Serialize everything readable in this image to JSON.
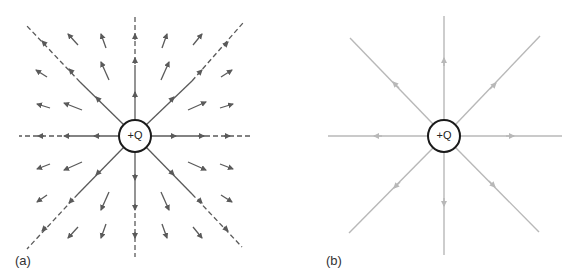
{
  "panels": [
    {
      "id": "a",
      "label": "(a)",
      "description": "Vector field arrows around positive point charge with dashed radial lines",
      "charge": {
        "label": "+Q",
        "cx": 135,
        "cy": 136,
        "r": 16
      },
      "line_color": "#5a5a5a",
      "line_style": "dash-solid"
    },
    {
      "id": "b",
      "label": "(b)",
      "description": "Electric field lines radiating outward from positive point charge",
      "charge": {
        "label": "+Q",
        "cx": 444,
        "cy": 136,
        "r": 16
      },
      "line_color": "#b8b8b8",
      "line_style": "solid"
    }
  ],
  "colors": {
    "background": "#ffffff",
    "charge_stroke": "#1a1a1a",
    "arrows_a": "#5a5a5a",
    "lines_b": "#b8b8b8"
  }
}
